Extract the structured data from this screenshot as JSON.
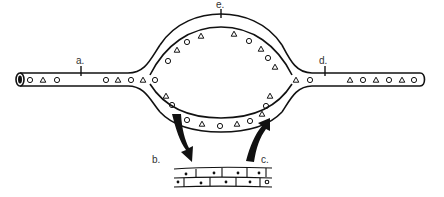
{
  "diagram": {
    "labels": {
      "a": "a.",
      "b": "b.",
      "c": "c.",
      "d": "d.",
      "e": "e."
    },
    "colors": {
      "stroke": "#111111",
      "background": "#ffffff",
      "label": "#333333"
    },
    "elements": {
      "left_vessel": "artery-tube",
      "right_vessel": "vein-tube",
      "loop": "capillary-loop",
      "tissue": "tissue-cells",
      "arrow_b": "arrow-to-tissue",
      "arrow_c": "arrow-from-tissue"
    }
  }
}
